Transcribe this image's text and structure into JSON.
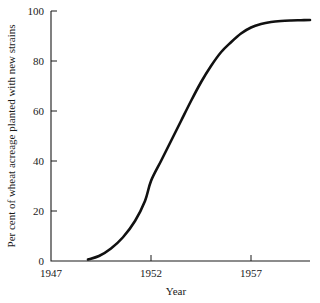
{
  "chart_data": {
    "type": "line",
    "title": "",
    "subtitle": "",
    "xlabel": "Year",
    "ylabel": "Per cent of wheat acreage planted with new strains",
    "xlim": [
      1947,
      1959.95
    ],
    "ylim": [
      0,
      100
    ],
    "grid": false,
    "legend": "none",
    "xticks": [
      1947,
      1952,
      1957
    ],
    "xtick_labels": [
      "1947",
      "1952",
      "1957"
    ],
    "yticks": [
      0,
      20,
      40,
      60,
      80,
      100
    ],
    "ytick_labels": [
      "0",
      "20",
      "40",
      "60",
      "80",
      "100"
    ],
    "series": [
      {
        "name": "Per cent of wheat acreage planted with new strains",
        "color": "#111111",
        "x": [
          1948.85,
          1949.4,
          1950.0,
          1950.6,
          1951.2,
          1951.7,
          1952.0,
          1952.5,
          1953.0,
          1953.5,
          1954.0,
          1954.5,
          1955.0,
          1955.5,
          1956.0,
          1956.5,
          1957.0,
          1957.5,
          1958.0,
          1958.5,
          1959.0,
          1959.5,
          1959.95
        ],
        "y": [
          0.6,
          2.0,
          5.0,
          9.5,
          16.0,
          24.0,
          32.0,
          40.0,
          48.0,
          56.0,
          64.0,
          71.5,
          78.0,
          83.5,
          87.5,
          91.0,
          93.4,
          94.8,
          95.6,
          96.0,
          96.2,
          96.3,
          96.4
        ]
      }
    ]
  },
  "axes": {
    "x_axis_name": "Year",
    "y_axis_name": "Per cent of wheat acreage planted with new strains"
  },
  "colors": {
    "background": "#ffffff",
    "axis": "#1a1a1a",
    "curve": "#111111"
  }
}
